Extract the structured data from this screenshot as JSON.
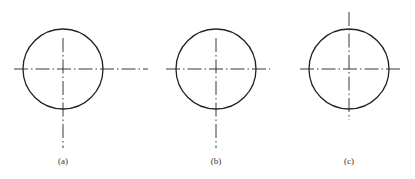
{
  "figure": {
    "stroke_color": "#222222",
    "panels": [
      {
        "id": "a",
        "label": "(a)",
        "circle": {
          "cx": 63,
          "cy": 69,
          "r": 40
        },
        "horizontal_centerline": {
          "x1": 14,
          "x2": 148,
          "y": 69
        },
        "vertical_centerline": {
          "x": 63,
          "y1": 38,
          "y2": 148
        },
        "label_pos": {
          "x": 63,
          "y": 157
        }
      },
      {
        "id": "b",
        "label": "(b)",
        "circle": {
          "cx": 216,
          "cy": 69,
          "r": 40
        },
        "horizontal_centerline": {
          "x1": 166,
          "x2": 270,
          "y": 69
        },
        "vertical_centerline": {
          "x": 216,
          "y1": 38,
          "y2": 148
        },
        "label_pos": {
          "x": 216,
          "y": 157
        }
      },
      {
        "id": "c",
        "label": "(c)",
        "circle": {
          "cx": 349,
          "cy": 69,
          "r": 40
        },
        "horizontal_centerline": {
          "x1": 300,
          "x2": 400,
          "y": 69
        },
        "vertical_centerline": {
          "x": 349,
          "y1": 12,
          "y2": 120
        },
        "label_pos": {
          "x": 349,
          "y": 157
        }
      }
    ]
  }
}
